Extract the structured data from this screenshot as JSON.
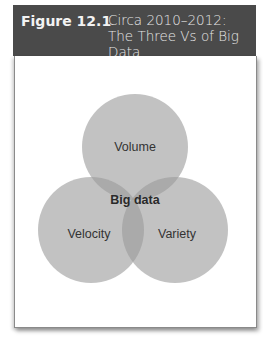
{
  "figure": {
    "number": "Figure 12.1",
    "title_line1": "Circa 2010–2012:",
    "title_line2": "The Three Vs of Big Data"
  },
  "venn": {
    "center_label": "Big data",
    "circles": [
      {
        "label": "Volume",
        "cx": 135,
        "cy": 147,
        "r": 47
      },
      {
        "label": "Velocity",
        "cx": 90,
        "cy": 236,
        "r": 47
      },
      {
        "label": "Variety",
        "cx": 181,
        "cy": 236,
        "r": 47
      }
    ],
    "fill_color": "#9a9a9a",
    "fill_opacity": 0.62
  }
}
